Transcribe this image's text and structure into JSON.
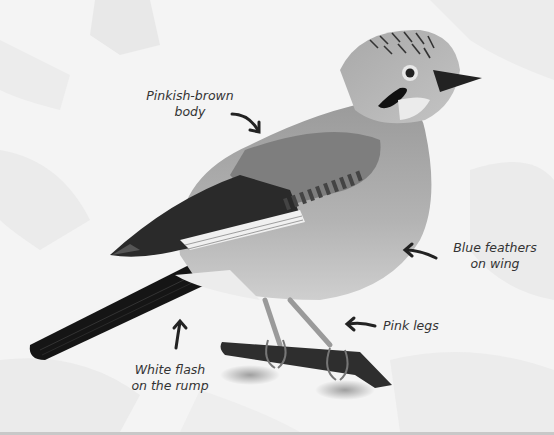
{
  "figure": {
    "colors": {
      "background": "#f3f3f3",
      "leaf_shapes": "#e9e9e9",
      "body": "#a9a9a9",
      "wing_dark": "#2a2a2a",
      "tail": "#151515",
      "label_text": "#333333"
    }
  },
  "labels": [
    {
      "id": "body",
      "line1": "Pinkish-brown",
      "line2": "body"
    },
    {
      "id": "wing",
      "line1": "Blue feathers",
      "line2": "on wing"
    },
    {
      "id": "legs",
      "line1": "Pink legs"
    },
    {
      "id": "rump",
      "line1": "White flash",
      "line2": "on the rump"
    }
  ]
}
